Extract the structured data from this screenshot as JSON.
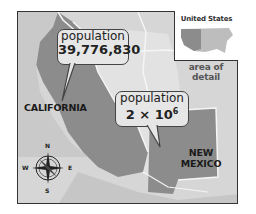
{
  "map": {
    "colors": {
      "background": "#d3d3d3",
      "highlight_state": "#8c8c8c",
      "other_land": "#dcdcdc",
      "borders": "#f5f5f5",
      "callout_fill": "#e6e6e6",
      "frame": "#333333"
    },
    "callouts": [
      {
        "line1": "population",
        "line2": "39,776,830"
      },
      {
        "line1": "population",
        "line2_base": "2 × 10",
        "line2_exp": "6"
      }
    ],
    "state_labels": {
      "california": "CALIFORNIA",
      "new_mexico_line1": "NEW",
      "new_mexico_line2": "MEXICO"
    },
    "inset": {
      "title": "United States",
      "caption": "area of detail"
    },
    "compass": {
      "n": "N",
      "s": "S",
      "e": "E",
      "w": "W"
    }
  }
}
